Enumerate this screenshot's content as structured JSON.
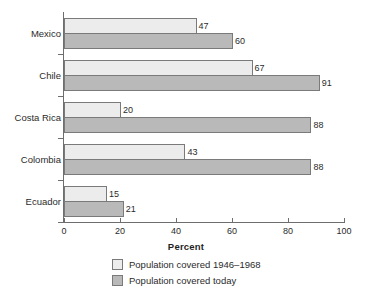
{
  "chart_data": {
    "type": "bar",
    "orientation": "horizontal",
    "title": "",
    "subtitle": "",
    "xlabel": "Percent",
    "ylabel": "",
    "categories": [
      "Mexico",
      "Chile",
      "Costa Rica",
      "Colombia",
      "Ecuador"
    ],
    "series": [
      {
        "name": "Population covered 1946–1968",
        "color": "#ececec",
        "values": [
          47,
          67,
          20,
          43,
          15
        ]
      },
      {
        "name": "Population covered today",
        "color": "#b9b9b9",
        "values": [
          60,
          91,
          88,
          88,
          21
        ]
      }
    ],
    "xlim": [
      0,
      100
    ],
    "xticks": [
      0,
      20,
      40,
      60,
      80,
      100
    ],
    "xtick_labels": [
      "0",
      "20",
      "40",
      "60",
      "80",
      "100"
    ],
    "grid": false,
    "legend_position": "bottom",
    "data_labels": true
  },
  "axis": {
    "title": "Percent",
    "tick_labels": [
      "0",
      "20",
      "40",
      "60",
      "80",
      "100"
    ]
  },
  "legend": {
    "items": [
      {
        "label": "Population covered 1946–1968",
        "swatch": "light-gray-swatch"
      },
      {
        "label": "Population covered today",
        "swatch": "medium-gray-swatch"
      }
    ]
  },
  "colors": {
    "series_1946_1968": "#ececec",
    "series_today": "#b9b9b9",
    "bar_border": "#7a7a7a",
    "axis_line": "#6e6e6e",
    "text": "#2b2b2b"
  }
}
